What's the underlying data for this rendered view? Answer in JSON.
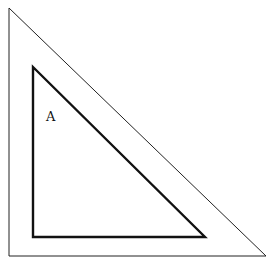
{
  "diagram": {
    "title": "",
    "labels": {
      "inner_region": "A"
    },
    "shapes": {
      "outer_triangle": {
        "points": [
          [
            9,
            8
          ],
          [
            9,
            256
          ],
          [
            266,
            256
          ]
        ],
        "stroke": "#222",
        "stroke_width": 1
      },
      "inner_triangle": {
        "points": [
          [
            33,
            67
          ],
          [
            33,
            237
          ],
          [
            205,
            237
          ]
        ],
        "stroke": "#111",
        "stroke_width": 2.4
      }
    }
  }
}
